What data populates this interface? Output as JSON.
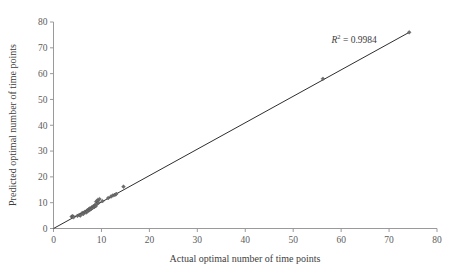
{
  "chart_data": {
    "type": "scatter",
    "title": "",
    "xlabel": "Actual optimal number of time points",
    "ylabel": "Predicted optimal number of time points",
    "xlim": [
      0,
      80
    ],
    "ylim": [
      0,
      80
    ],
    "xticks": [
      0,
      10,
      20,
      30,
      40,
      50,
      60,
      70,
      80
    ],
    "yticks": [
      0,
      10,
      20,
      30,
      40,
      50,
      60,
      70,
      80
    ],
    "xtick_labels": [
      "0",
      "10",
      "20",
      "30",
      "40",
      "50",
      "60",
      "70",
      "80"
    ],
    "ytick_labels": [
      "0",
      "10",
      "20",
      "30",
      "40",
      "50",
      "60",
      "70",
      "80"
    ],
    "grid": false,
    "legend": false,
    "marker": "diamond",
    "marker_color": "#6d6d6d",
    "trend_line": {
      "visible": true,
      "color": "#2e2e2e",
      "x_start": 0,
      "y_start": 0,
      "x_end": 74.2,
      "y_end": 76.0
    },
    "annotations": [
      {
        "name": "r-squared",
        "prefix": "R",
        "superscript": "2",
        "suffix": " = 0.9984",
        "text": "R2 = 0.9984",
        "value": 0.9984,
        "x": 58,
        "y": 72
      }
    ],
    "points": [
      {
        "x": 3.8,
        "y": 4.6
      },
      {
        "x": 4.0,
        "y": 4.8
      },
      {
        "x": 4.2,
        "y": 4.4
      },
      {
        "x": 5.0,
        "y": 4.9
      },
      {
        "x": 5.4,
        "y": 5.3
      },
      {
        "x": 5.6,
        "y": 5.0
      },
      {
        "x": 6.0,
        "y": 6.0
      },
      {
        "x": 6.2,
        "y": 5.6
      },
      {
        "x": 6.5,
        "y": 6.4
      },
      {
        "x": 6.8,
        "y": 6.2
      },
      {
        "x": 7.0,
        "y": 7.0
      },
      {
        "x": 7.1,
        "y": 6.6
      },
      {
        "x": 7.3,
        "y": 7.4
      },
      {
        "x": 7.5,
        "y": 7.1
      },
      {
        "x": 7.6,
        "y": 7.8
      },
      {
        "x": 7.8,
        "y": 7.5
      },
      {
        "x": 8.0,
        "y": 8.2
      },
      {
        "x": 8.1,
        "y": 7.9
      },
      {
        "x": 8.3,
        "y": 8.6
      },
      {
        "x": 8.5,
        "y": 8.3
      },
      {
        "x": 8.6,
        "y": 9.0
      },
      {
        "x": 8.8,
        "y": 8.7
      },
      {
        "x": 8.9,
        "y": 10.4
      },
      {
        "x": 9.0,
        "y": 9.4
      },
      {
        "x": 9.2,
        "y": 11.0
      },
      {
        "x": 9.4,
        "y": 10.0
      },
      {
        "x": 9.6,
        "y": 11.4
      },
      {
        "x": 10.2,
        "y": 10.6
      },
      {
        "x": 11.4,
        "y": 11.8
      },
      {
        "x": 12.0,
        "y": 12.4
      },
      {
        "x": 12.4,
        "y": 12.8
      },
      {
        "x": 12.8,
        "y": 13.0
      },
      {
        "x": 13.1,
        "y": 13.4
      },
      {
        "x": 14.6,
        "y": 16.2
      },
      {
        "x": 56.2,
        "y": 58.0
      },
      {
        "x": 74.2,
        "y": 76.0
      }
    ]
  }
}
